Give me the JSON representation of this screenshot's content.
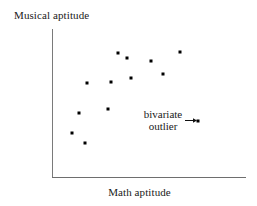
{
  "figure": {
    "background_color": "#ffffff",
    "point_color": "#000000",
    "axis_color": "#6e6e6e",
    "text_color": "#1a1a1a"
  },
  "axes": {
    "y_label": "Musical aptitude",
    "x_label": "Math aptitude"
  },
  "annotation": {
    "line1": "bivariate",
    "line2": "outlier",
    "arrow_direction": "right"
  },
  "chart_data": {
    "type": "scatter",
    "title": "",
    "xlabel": "Math aptitude",
    "ylabel": "Musical aptitude",
    "xlim": [
      0,
      100
    ],
    "ylim": [
      0,
      100
    ],
    "grid": false,
    "legend": null,
    "axis_ticks": {
      "x": [],
      "y": []
    },
    "series": [
      {
        "name": "students",
        "marker": "square",
        "color": "#000000",
        "points": [
          {
            "label": "p1",
            "x": 14,
            "y": 43,
            "px": 79,
            "py": 113
          },
          {
            "label": "p2",
            "x": 10,
            "y": 30,
            "px": 72,
            "py": 133
          },
          {
            "label": "p3",
            "x": 17,
            "y": 23,
            "px": 85,
            "py": 143
          },
          {
            "label": "p4",
            "x": 18,
            "y": 64,
            "px": 87,
            "py": 83
          },
          {
            "label": "p5",
            "x": 29,
            "y": 47,
            "px": 108,
            "py": 109
          },
          {
            "label": "p6",
            "x": 30,
            "y": 65,
            "px": 111,
            "py": 82
          },
          {
            "label": "p7",
            "x": 34,
            "y": 84,
            "px": 118,
            "py": 53
          },
          {
            "label": "p8",
            "x": 41,
            "y": 68,
            "px": 131,
            "py": 78
          },
          {
            "label": "p9",
            "x": 51,
            "y": 74,
            "px": 151,
            "py": 61
          },
          {
            "label": "p10",
            "x": 57,
            "y": 58,
            "px": 163,
            "py": 74
          },
          {
            "label": "p11",
            "x": 66,
            "y": 85,
            "px": 180,
            "py": 52
          },
          {
            "label": "p12",
            "x": 39,
            "y": 80,
            "px": 127,
            "py": 58
          }
        ]
      },
      {
        "name": "bivariate outlier",
        "marker": "square",
        "color": "#000000",
        "points": [
          {
            "label": "outlier",
            "x": 76,
            "y": 38,
            "px": 198,
            "py": 121
          }
        ]
      }
    ],
    "annotations": [
      {
        "text": "bivariate outlier",
        "points_to": {
          "px": 198,
          "py": 121
        },
        "arrow": true
      }
    ]
  }
}
